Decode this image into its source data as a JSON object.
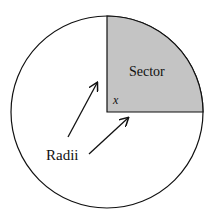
{
  "diagram": {
    "labels": {
      "sector": "Sector",
      "angle": "x",
      "radii": "Radii"
    },
    "colors": {
      "sector_fill": "#c4c4c4",
      "stroke": "#111111",
      "background": "#ffffff"
    }
  }
}
